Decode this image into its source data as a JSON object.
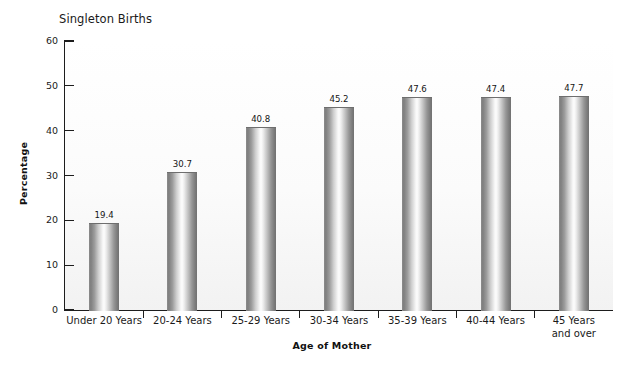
{
  "chart_data": {
    "type": "bar",
    "title": "Singleton Births",
    "xlabel": "Age of Mother",
    "ylabel": "Percentage",
    "categories": [
      "Under 20 Years",
      "20-24 Years",
      "25-29 Years",
      "30-34 Years",
      "35-39 Years",
      "40-44 Years",
      "45 Years\nand over"
    ],
    "values": [
      19.4,
      30.7,
      40.8,
      45.2,
      47.6,
      47.4,
      47.7
    ],
    "value_labels": [
      "19.4",
      "30.7",
      "40.8",
      "45.2",
      "47.6",
      "47.4",
      "47.7"
    ],
    "ylim": [
      0,
      60
    ],
    "yticks": [
      0,
      10,
      20,
      30,
      40,
      50,
      60
    ],
    "ytick_labels": [
      "0",
      "10",
      "20",
      "30",
      "40",
      "50",
      "60"
    ],
    "grid": false,
    "legend": false,
    "bar_style": "cylinder-gradient-grayscale",
    "colors": {
      "axis": "#1d1d1d",
      "text": "#1a1a1a",
      "bar_light": "#fdfdfd",
      "bar_dark": "#717171",
      "background": "#ffffff"
    }
  }
}
